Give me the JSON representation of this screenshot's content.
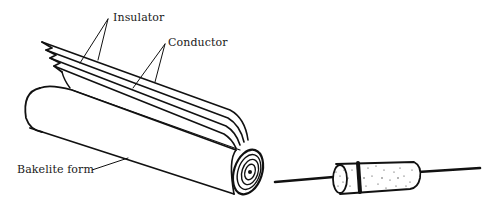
{
  "diagram": {
    "labels": {
      "insulator": "Insulator",
      "conductor": "Conductor",
      "bakelite_form": "Bakelite form"
    },
    "parts": [
      {
        "id": "rolled-layers",
        "description": "Rolled insulator and conductor foil layers on a bakelite form"
      },
      {
        "id": "finished-capacitor",
        "description": "Finished cylindrical capacitor with axial leads"
      }
    ],
    "colors": {
      "ink": "#111111",
      "paper": "#ffffff"
    }
  }
}
